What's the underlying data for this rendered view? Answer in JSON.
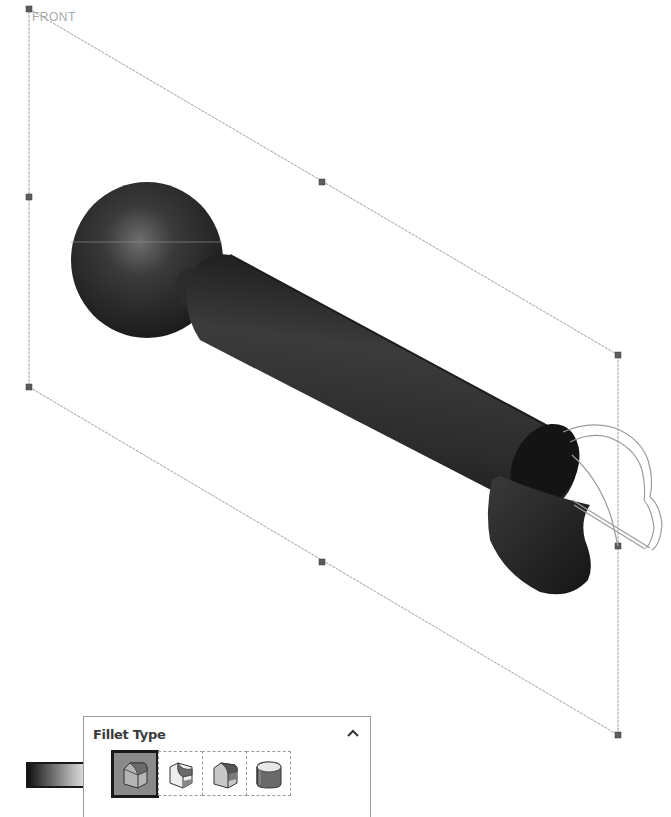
{
  "viewport": {
    "view_label": "FRONT",
    "plane": {
      "corners": [
        [
          29,
          9
        ],
        [
          618,
          355
        ],
        [
          618,
          735
        ],
        [
          29,
          387
        ]
      ],
      "handles": [
        [
          29,
          9
        ],
        [
          322,
          182
        ],
        [
          618,
          355
        ],
        [
          618,
          546
        ],
        [
          618,
          735
        ],
        [
          322,
          562
        ],
        [
          29,
          387
        ],
        [
          29,
          197
        ]
      ],
      "line_color": "#9a9a9a",
      "handle_color": "#5a5a5a"
    },
    "model": {
      "body_color": "#2a2a2a",
      "highlight_color": "#6a6a6a",
      "preview_outline_color": "#9a9a9a"
    }
  },
  "fillet_panel": {
    "title": "Fillet Type",
    "collapse_icon": "chevron-up-icon",
    "options": [
      {
        "name": "constant-size-fillet",
        "icon": "constant-size-fillet-icon",
        "selected": true
      },
      {
        "name": "variable-size-fillet",
        "icon": "variable-size-fillet-icon",
        "selected": false
      },
      {
        "name": "face-fillet",
        "icon": "face-fillet-icon",
        "selected": false
      },
      {
        "name": "full-round-fillet",
        "icon": "full-round-fillet-icon",
        "selected": false
      }
    ]
  },
  "callout_arrow": {
    "icon": "pointer-arrow-icon",
    "target": "constant-size-fillet"
  }
}
